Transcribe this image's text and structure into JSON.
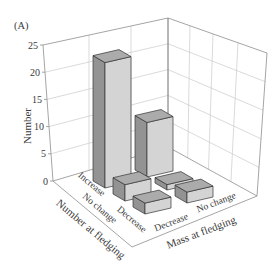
{
  "chart_data": {
    "type": "bar",
    "projection": "3d",
    "title": "(A)",
    "xlabel": "Number at fledging",
    "zlabel": "Mass at fledging",
    "ylabel": "Number",
    "categories": [
      "Increase",
      "No change",
      "Decrease"
    ],
    "series_axis_label": "Mass at fledging",
    "series": [
      {
        "name": "Decrease",
        "values": [
          23,
          3,
          2
        ]
      },
      {
        "name": "No change",
        "values": [
          10,
          1,
          2
        ]
      }
    ],
    "yticks": [
      0,
      5,
      10,
      15,
      20,
      25
    ],
    "ylim": [
      0,
      25
    ],
    "grid": true,
    "legend": null,
    "colors": {
      "bar_top": "#ababab",
      "bar_side": "#939393",
      "bar_front": "#d4d4d4"
    }
  }
}
